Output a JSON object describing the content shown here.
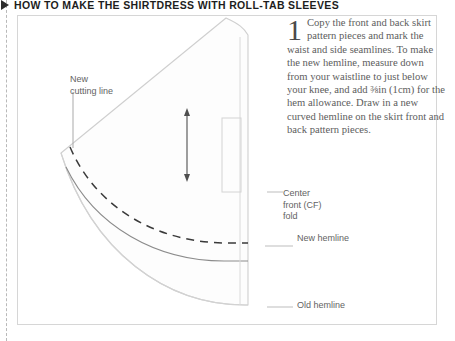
{
  "header": {
    "bullet_icon": "triangle-right-icon",
    "title": "HOW TO MAKE THE SHIRTDRESS WITH ROLL-TAB SLEEVES"
  },
  "instruction": {
    "step_number": "1",
    "text": "Copy the front and back skirt pattern pieces and mark the waist and side seamlines. To make the new hemline, measure down from your waistline to just below your knee, and add ⅜in (1cm) for the hem allowance. Draw in a new curved hemline on the skirt front and back pattern pieces."
  },
  "diagram": {
    "labels": {
      "new_cutting_line": "New\ncutting line",
      "center_front_fold": "Center\nfront (CF)\nfold",
      "new_hemline": "New hemline",
      "old_hemline": "Old hemline"
    },
    "elements": {
      "pattern_piece": "skirt-pattern-outline",
      "measure_arrow": "double-headed-arrow",
      "cf_fold_marker": "fold-rectangle-marker"
    }
  },
  "colors": {
    "header_text": "#1d1d1d",
    "body_text": "#5d5d5d",
    "label_text": "#636363",
    "box_border": "#d6d6d6",
    "pattern_outline": "#cfcfcf",
    "pattern_fill": "#fdfdfd",
    "new_hemline_stroke": "#8b8b8b",
    "old_hemline_stroke": "#d2d2d2",
    "cutting_line_stroke": "#3a3a3a",
    "leader_line": "#bdbdbd",
    "trim_line": "#b9b9b9"
  }
}
